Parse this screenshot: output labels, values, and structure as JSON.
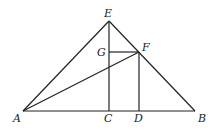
{
  "diagram": {
    "type": "geometry",
    "points": {
      "A": {
        "label": "A",
        "x": 23,
        "y": 111,
        "lx": 13,
        "ly": 122
      },
      "B": {
        "label": "B",
        "x": 195,
        "y": 111,
        "lx": 198,
        "ly": 122
      },
      "C": {
        "label": "C",
        "x": 109,
        "y": 111,
        "lx": 104,
        "ly": 122
      },
      "D": {
        "label": "D",
        "x": 139,
        "y": 111,
        "lx": 134,
        "ly": 122
      },
      "E": {
        "label": "E",
        "x": 109,
        "y": 21,
        "lx": 104,
        "ly": 17
      },
      "F": {
        "label": "F",
        "x": 139,
        "y": 52,
        "lx": 142,
        "ly": 51
      },
      "G": {
        "label": "G",
        "x": 109,
        "y": 52,
        "lx": 97,
        "ly": 56
      }
    },
    "segments": [
      [
        "A",
        "B"
      ],
      [
        "A",
        "E"
      ],
      [
        "E",
        "B"
      ],
      [
        "E",
        "C"
      ],
      [
        "G",
        "F"
      ],
      [
        "F",
        "D"
      ],
      [
        "A",
        "F"
      ]
    ],
    "line_color": "#222222"
  }
}
